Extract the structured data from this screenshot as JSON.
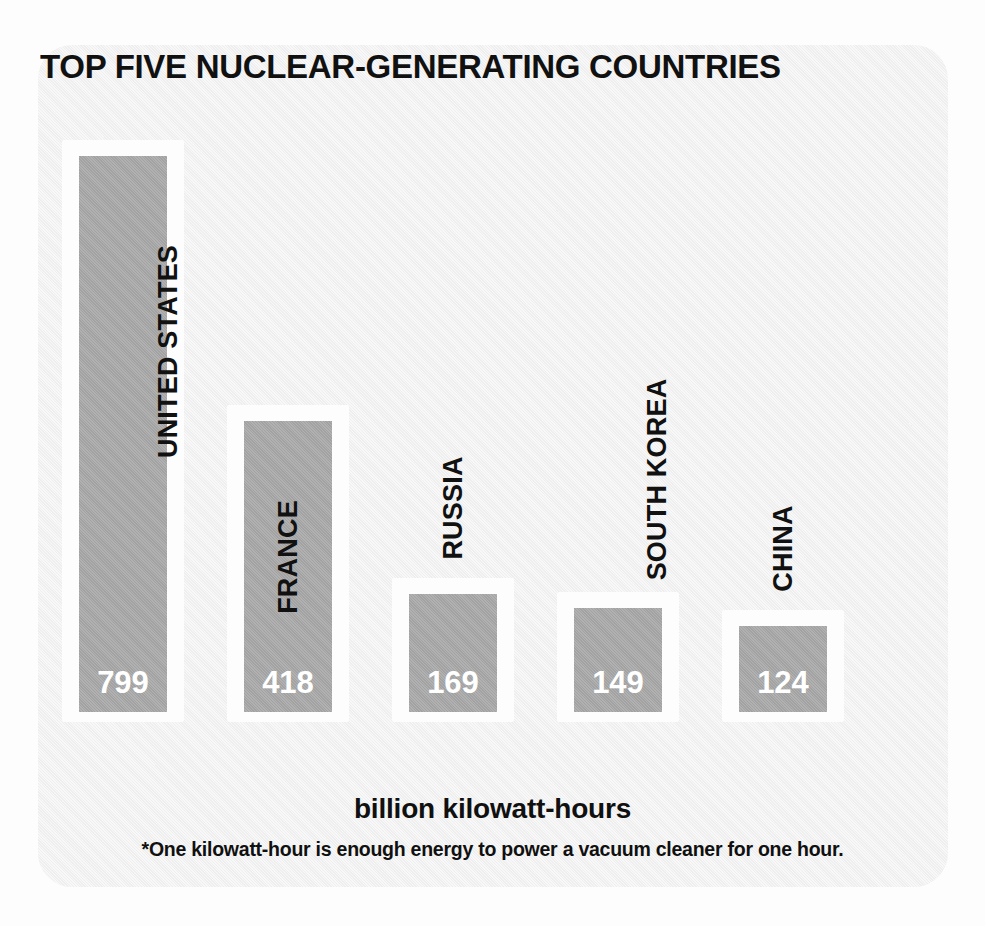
{
  "chart_data": {
    "type": "bar",
    "title": "TOP FIVE NUCLEAR-GENERATING COUNTRIES",
    "categories": [
      "UNITED STATES",
      "FRANCE",
      "RUSSIA",
      "SOUTH KOREA",
      "CHINA"
    ],
    "values": [
      799,
      418,
      169,
      149,
      124
    ],
    "xlabel": "",
    "ylabel": "billion kilowatt-hours",
    "ylim": [
      0,
      799
    ],
    "grid": false,
    "legend": "none",
    "value_label_color": "#ffffff",
    "bar_color": "#a8a8a8",
    "bar_frame_color": "#fdfdfd",
    "annotations": [
      "*One kilowatt-hour is enough energy to power a vacuum cleaner for one hour."
    ],
    "bars": [
      {
        "category": "UNITED STATES",
        "value": 799,
        "value_label": "799"
      },
      {
        "category": "FRANCE",
        "value": 418,
        "value_label": "418"
      },
      {
        "category": "RUSSIA",
        "value": 169,
        "value_label": "169"
      },
      {
        "category": "SOUTH KOREA",
        "value": 149,
        "value_label": "149"
      },
      {
        "category": "CHINA",
        "value": 124,
        "value_label": "124"
      }
    ]
  },
  "captions": {
    "axis_caption": "billion kilowatt-hours",
    "footnote": "*One kilowatt-hour is enough energy to power a vacuum cleaner for one hour."
  },
  "colors": {
    "page_background": "#fdfdfd",
    "card_background": "#f1f1f1",
    "bar": "#a8a8a8",
    "bar_frame": "#fdfdfd",
    "text": "#111111",
    "value_text": "#ffffff"
  }
}
